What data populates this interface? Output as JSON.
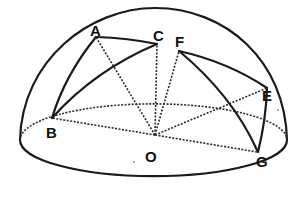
{
  "diagram": {
    "points": [
      {
        "id": "A",
        "label": "A"
      },
      {
        "id": "B",
        "label": "B"
      },
      {
        "id": "C",
        "label": "C"
      },
      {
        "id": "E",
        "label": "E"
      },
      {
        "id": "F",
        "label": "F"
      },
      {
        "id": "G",
        "label": "G"
      },
      {
        "id": "O",
        "label": "O"
      }
    ],
    "arcs": [
      [
        "A",
        "B"
      ],
      [
        "A",
        "C"
      ],
      [
        "B",
        "C"
      ],
      [
        "F",
        "E"
      ],
      [
        "F",
        "G"
      ],
      [
        "E",
        "G"
      ]
    ],
    "radii_to_center": [
      "A",
      "B",
      "C",
      "E",
      "F",
      "G"
    ],
    "colors": {
      "ink": "#1a1a1a",
      "background": "#ffffff"
    }
  }
}
